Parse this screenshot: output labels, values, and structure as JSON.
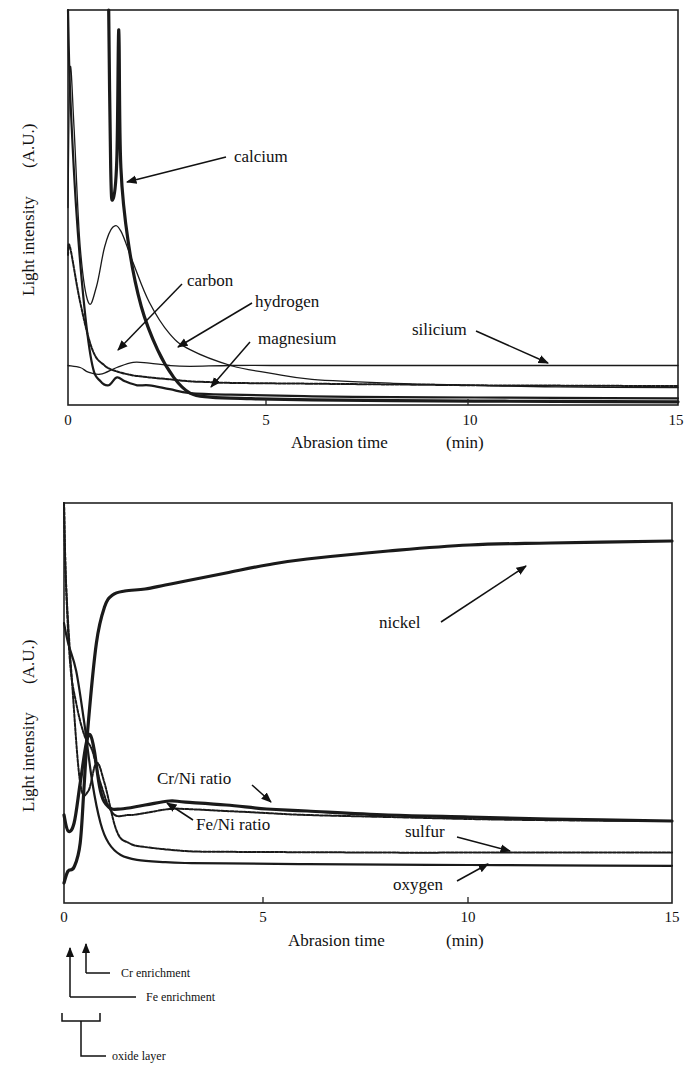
{
  "chart_data": [
    {
      "type": "line",
      "title": "",
      "xlabel": "Abrasion time",
      "xunit": "(min)",
      "ylabel": "Light intensity",
      "yunit": "(A.U.)",
      "xlim": [
        0,
        15
      ],
      "ylim": [
        0,
        100
      ],
      "xticks": [
        0,
        5,
        10,
        15
      ],
      "grid": false,
      "legend": "inline annotations with arrows",
      "series": [
        {
          "name": "calcium",
          "style": "thick",
          "x": [
            1.0,
            1.05,
            1.1,
            1.2,
            1.25,
            1.3,
            1.5,
            1.8,
            2.2,
            2.6,
            3.0,
            3.5,
            4.5,
            6,
            8,
            10,
            12,
            15
          ],
          "y": [
            100,
            60,
            52,
            62,
            95,
            60,
            40,
            25,
            14,
            7,
            3,
            2,
            1.6,
            1.3,
            1.1,
            1.0,
            0.9,
            0.8
          ]
        },
        {
          "name": "carbon",
          "style": "medium",
          "x": [
            0,
            0.05,
            0.2,
            0.4,
            0.6,
            0.8,
            1.0,
            1.2,
            1.4,
            1.7,
            2.0,
            2.5,
            3.0,
            4,
            6,
            8,
            10,
            12,
            15
          ],
          "y": [
            100,
            80,
            50,
            25,
            10,
            6,
            5,
            7,
            6,
            5,
            5,
            4,
            3,
            2.6,
            2.2,
            2.0,
            1.9,
            1.8,
            1.7
          ]
        },
        {
          "name": "hydrogen",
          "style": "thin",
          "x": [
            0,
            0.05,
            0.15,
            0.3,
            0.5,
            0.7,
            0.9,
            1.1,
            1.3,
            1.6,
            2.0,
            2.5,
            3.0,
            4,
            5,
            6,
            8,
            10,
            12,
            15
          ],
          "y": [
            50,
            85,
            70,
            40,
            26,
            30,
            40,
            45,
            44,
            36,
            26,
            18,
            14,
            10,
            8,
            6.5,
            5.5,
            5,
            4.6,
            4.4
          ]
        },
        {
          "name": "magnesium",
          "style": "dashed",
          "x": [
            0,
            0.05,
            0.3,
            0.6,
            0.9,
            1.2,
            1.6,
            2.0,
            2.5,
            3.0,
            3.5,
            4,
            6,
            8,
            10,
            12,
            15
          ],
          "y": [
            38,
            40,
            26,
            14,
            10,
            8.5,
            7.5,
            7,
            6.5,
            6,
            5.8,
            5.6,
            5.4,
            5.2,
            5,
            4.9,
            4.8
          ]
        },
        {
          "name": "silicium",
          "style": "thin",
          "x": [
            0,
            0.3,
            0.5,
            0.8,
            1.2,
            1.6,
            2.0,
            2.5,
            3.0,
            4,
            5,
            6,
            8,
            10,
            12,
            15
          ],
          "y": [
            10,
            9.5,
            8.3,
            7.8,
            9.5,
            10.8,
            10.6,
            10,
            9.8,
            10,
            10,
            10,
            10,
            10,
            10,
            10
          ]
        }
      ],
      "annotations": [
        "calcium",
        "carbon",
        "hydrogen",
        "magnesium",
        "silicium"
      ]
    },
    {
      "type": "line",
      "title": "",
      "xlabel": "Abrasion time",
      "xunit": "(min)",
      "ylabel": "Light intensity",
      "yunit": "(A.U.)",
      "xlim": [
        0,
        15
      ],
      "ylim": [
        0,
        100
      ],
      "xticks": [
        0,
        5,
        10,
        15
      ],
      "grid": false,
      "legend": "inline annotations with arrows",
      "series": [
        {
          "name": "nickel",
          "style": "thick",
          "x": [
            0,
            0.1,
            0.25,
            0.4,
            0.5,
            0.6,
            0.8,
            1.0,
            1.2,
            1.5,
            2.0,
            2.5,
            3.0,
            4,
            5,
            6,
            8,
            10,
            12,
            15
          ],
          "y": [
            5,
            8,
            9,
            15,
            30,
            45,
            65,
            74,
            77,
            78,
            78.5,
            79.5,
            80.5,
            82.5,
            84.5,
            86,
            88,
            89.5,
            90,
            90.5
          ]
        },
        {
          "name": "Cr/Ni ratio",
          "style": "thick",
          "x": [
            0,
            0.1,
            0.25,
            0.4,
            0.55,
            0.65,
            0.75,
            0.9,
            1.1,
            1.4,
            2.0,
            2.6,
            3.0,
            4,
            5,
            6,
            8,
            10,
            12,
            15
          ],
          "y": [
            22,
            18,
            20,
            30,
            40,
            42,
            38,
            28,
            24,
            23.5,
            24.5,
            25.5,
            25.2,
            24.5,
            23.5,
            23,
            22,
            21.5,
            21,
            20.5
          ]
        },
        {
          "name": "Fe/Ni ratio",
          "style": "dashed-thick",
          "x": [
            0,
            0.05,
            0.15,
            0.3,
            0.5,
            0.7,
            0.9,
            1.2,
            1.6,
            2.0,
            2.6,
            3.0,
            4,
            5,
            6,
            8,
            10,
            12,
            15
          ],
          "y": [
            100,
            80,
            60,
            50,
            42,
            38,
            30,
            22.5,
            22,
            22.5,
            23.5,
            23.5,
            23,
            22.5,
            22,
            21.5,
            21,
            20.7,
            20.5
          ]
        },
        {
          "name": "sulfur",
          "style": "dashed",
          "x": [
            0,
            0.05,
            0.2,
            0.4,
            0.6,
            0.8,
            1.0,
            1.3,
            1.6,
            2.0,
            3.0,
            4,
            6,
            8,
            10,
            12,
            15
          ],
          "y": [
            100,
            80,
            55,
            30,
            28,
            35,
            30,
            18,
            15,
            14,
            13,
            12.8,
            12.7,
            12.6,
            12.6,
            12.6,
            12.6
          ]
        },
        {
          "name": "oxygen",
          "style": "medium",
          "x": [
            0,
            0.1,
            0.3,
            0.5,
            0.7,
            0.9,
            1.1,
            1.4,
            1.8,
            2.5,
            3.0,
            4,
            6,
            8,
            10,
            12,
            15
          ],
          "y": [
            70,
            65,
            58,
            45,
            30,
            20,
            15,
            12,
            10.8,
            10.2,
            10,
            9.9,
            9.7,
            9.6,
            9.5,
            9.4,
            9.3
          ]
        }
      ],
      "annotations": [
        "nickel",
        "Cr/Ni ratio",
        "Fe/Ni ratio",
        "sulfur",
        "oxygen"
      ]
    }
  ],
  "top_chart": {
    "xlabel": "Abrasion time",
    "xunit": "(min)",
    "ylabel": "Light intensity",
    "yunit": "(A.U.)",
    "ticks": [
      "0",
      "5",
      "10",
      "15"
    ],
    "labels": {
      "calcium": "calcium",
      "carbon": "carbon",
      "hydrogen": "hydrogen",
      "magnesium": "magnesium",
      "silicium": "silicium"
    }
  },
  "bottom_chart": {
    "xlabel": "Abrasion time",
    "xunit": "(min)",
    "ylabel": "Light intensity",
    "yunit": "(A.U.)",
    "ticks": [
      "0",
      "5",
      "10",
      "15"
    ],
    "labels": {
      "nickel": "nickel",
      "crni": "Cr/Ni ratio",
      "feni": "Fe/Ni ratio",
      "sulfur": "sulfur",
      "oxygen": "oxygen"
    },
    "markers": {
      "cr": "Cr enrichment",
      "fe": "Fe enrichment",
      "oxide": "oxide layer"
    }
  }
}
